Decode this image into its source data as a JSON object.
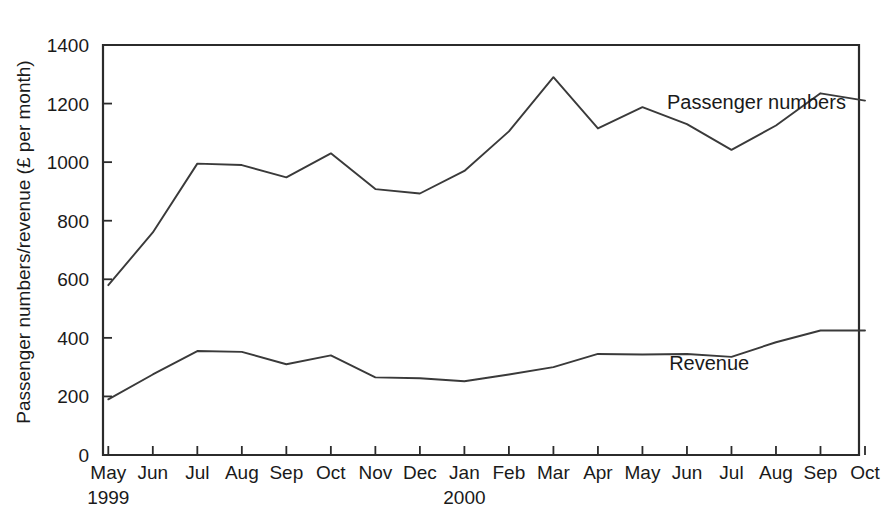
{
  "chart_data": {
    "type": "line",
    "title": "",
    "xlabel": "",
    "ylabel": "Passenger numbers/revenue (£ per month)",
    "ylim": [
      0,
      1400
    ],
    "ytick_values": [
      0,
      200,
      400,
      600,
      800,
      1000,
      1200,
      1400
    ],
    "ytick_labels": [
      "0",
      "200",
      "400",
      "600",
      "800",
      "1000",
      "1200",
      "1400"
    ],
    "grid": false,
    "legend_position": "inline-annotations",
    "categories": [
      "May",
      "Jun",
      "Jul",
      "Aug",
      "Sep",
      "Oct",
      "Nov",
      "Dec",
      "Jan",
      "Feb",
      "Mar",
      "Apr",
      "May",
      "Jun",
      "Jul",
      "Aug",
      "Sep",
      "Oct"
    ],
    "year_groups": [
      {
        "label": "1999",
        "start_index": 0
      },
      {
        "label": "2000",
        "start_index": 8
      }
    ],
    "series": [
      {
        "name": "Passenger numbers",
        "label_x_index": 12.55,
        "label_value": 1180,
        "values": [
          580,
          760,
          995,
          990,
          948,
          1030,
          908,
          893,
          970,
          1105,
          1290,
          1115,
          1188,
          1130,
          1042,
          1125,
          1235,
          1210
        ]
      },
      {
        "name": "Revenue",
        "label_x_index": 12.6,
        "label_value": 290,
        "values": [
          190,
          275,
          355,
          352,
          310,
          340,
          265,
          262,
          252,
          275,
          300,
          345,
          343,
          345,
          335,
          385,
          425,
          425
        ]
      }
    ]
  },
  "annotations": {
    "passenger_label": "Passenger numbers",
    "revenue_label": "Revenue"
  }
}
